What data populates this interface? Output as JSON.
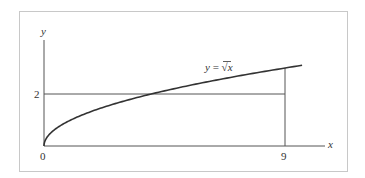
{
  "chart_data": {
    "type": "line",
    "title": "",
    "xlabel": "x",
    "ylabel": "y",
    "series": [
      {
        "name": "y = √x",
        "function": "sqrt(x)",
        "x": [
          0,
          0.25,
          0.5,
          1,
          2,
          3,
          4,
          5,
          6,
          7,
          8,
          9,
          9.63
        ],
        "values": [
          0,
          0.5,
          0.707,
          1,
          1.414,
          1.732,
          2,
          2.236,
          2.449,
          2.646,
          2.828,
          3,
          3.103
        ]
      }
    ],
    "reference_lines": [
      {
        "type": "horizontal",
        "y": 2,
        "x_range": [
          0,
          9
        ]
      },
      {
        "type": "vertical",
        "x": 9,
        "y_range": [
          0,
          3
        ]
      }
    ],
    "x_ticks": [
      {
        "value": 0,
        "label": "0"
      },
      {
        "value": 9,
        "label": "9"
      }
    ],
    "y_ticks": [
      {
        "value": 2,
        "label": "2"
      }
    ],
    "xlim": [
      0,
      10.5
    ],
    "ylim": [
      0,
      4.3
    ],
    "grid": false,
    "legend": "none",
    "annotations": [
      {
        "text": "y = √x",
        "x": 6.5,
        "y": 3.0
      }
    ]
  },
  "labels": {
    "y_axis": "y",
    "x_axis": "x",
    "tick_two": "2",
    "tick_zero": "0",
    "tick_nine": "9",
    "curve_label_y": "y",
    "curve_label_eq": " = ",
    "curve_label_sqrt": "√",
    "curve_label_x": "x"
  },
  "colors": {
    "frame": "#c8c8c8",
    "axis": "#555555",
    "curve": "#333333",
    "text": "#333333"
  }
}
